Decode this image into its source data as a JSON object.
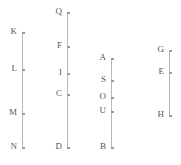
{
  "figure": {
    "background_color": "#ffffff",
    "line_color": "#b8b8b8",
    "label_color": "#55555a",
    "width": 181,
    "height": 165
  },
  "chart_data": {
    "type": "scatter",
    "title": "",
    "subtitle": "",
    "xlabel": "",
    "ylabel": "",
    "grid": false,
    "legend": null,
    "axis_orientation": "vertical",
    "xlim": [
      0,
      181
    ],
    "ylim": [
      0,
      165
    ],
    "series": [
      {
        "name": "line-1",
        "x": 22,
        "y_top": 33,
        "y_bottom": 148,
        "points": [
          {
            "label": "K",
            "x": 22,
            "y": 33
          },
          {
            "label": "L",
            "x": 22,
            "y": 70
          },
          {
            "label": "M",
            "x": 22,
            "y": 114
          },
          {
            "label": "N",
            "x": 22,
            "y": 148
          }
        ]
      },
      {
        "name": "line-2",
        "x": 67,
        "y_top": 13,
        "y_bottom": 148,
        "points": [
          {
            "label": "Q",
            "x": 67,
            "y": 13
          },
          {
            "label": "F",
            "x": 67,
            "y": 47
          },
          {
            "label": "I",
            "x": 67,
            "y": 74
          },
          {
            "label": "C",
            "x": 67,
            "y": 95
          },
          {
            "label": "D",
            "x": 67,
            "y": 148
          }
        ]
      },
      {
        "name": "line-3",
        "x": 111,
        "y_top": 59,
        "y_bottom": 148,
        "points": [
          {
            "label": "A",
            "x": 111,
            "y": 59
          },
          {
            "label": "S",
            "x": 111,
            "y": 81
          },
          {
            "label": "O",
            "x": 111,
            "y": 98
          },
          {
            "label": "U",
            "x": 111,
            "y": 112
          },
          {
            "label": "B",
            "x": 111,
            "y": 148
          }
        ]
      },
      {
        "name": "line-4",
        "x": 169,
        "y_top": 51,
        "y_bottom": 116,
        "points": [
          {
            "label": "G",
            "x": 169,
            "y": 51
          },
          {
            "label": "E",
            "x": 169,
            "y": 73
          },
          {
            "label": "H",
            "x": 169,
            "y": 116
          }
        ]
      }
    ]
  }
}
